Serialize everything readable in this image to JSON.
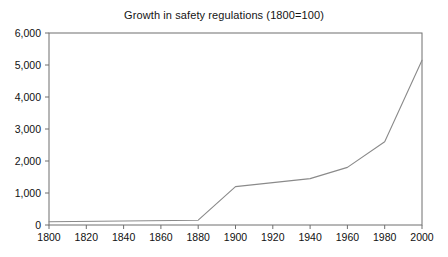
{
  "chart_data": {
    "type": "line",
    "title": "Growth in safety regulations (1800=100)",
    "xlabel": "",
    "ylabel": "",
    "x": [
      1800,
      1880,
      1900,
      1940,
      1960,
      1980,
      2000
    ],
    "values": [
      100,
      150,
      1200,
      1450,
      1800,
      2600,
      5150
    ],
    "series": [
      {
        "name": "Growth in safety regulations",
        "x": [
          1800,
          1880,
          1900,
          1940,
          1960,
          1980,
          2000
        ],
        "values": [
          100,
          150,
          1200,
          1450,
          1800,
          2600,
          5150
        ]
      }
    ],
    "xlim": [
      1800,
      2000
    ],
    "ylim": [
      0,
      6000
    ],
    "xticks": [
      1800,
      1820,
      1840,
      1860,
      1880,
      1900,
      1920,
      1940,
      1960,
      1980,
      2000
    ],
    "yticks": [
      0,
      1000,
      2000,
      3000,
      4000,
      5000,
      6000
    ],
    "xtick_labels": [
      "1800",
      "1820",
      "1840",
      "1860",
      "1880",
      "1900",
      "1920",
      "1940",
      "1960",
      "1980",
      "2000"
    ],
    "ytick_labels": [
      "0",
      "1,000",
      "2,000",
      "3,000",
      "4,000",
      "5,000",
      "6,000"
    ],
    "grid": false,
    "legend": null,
    "annotations": [],
    "colors": {
      "line": "#8a8a8a",
      "axis": "#6f6f6f",
      "background": "#ffffff",
      "text": "#141414"
    }
  }
}
